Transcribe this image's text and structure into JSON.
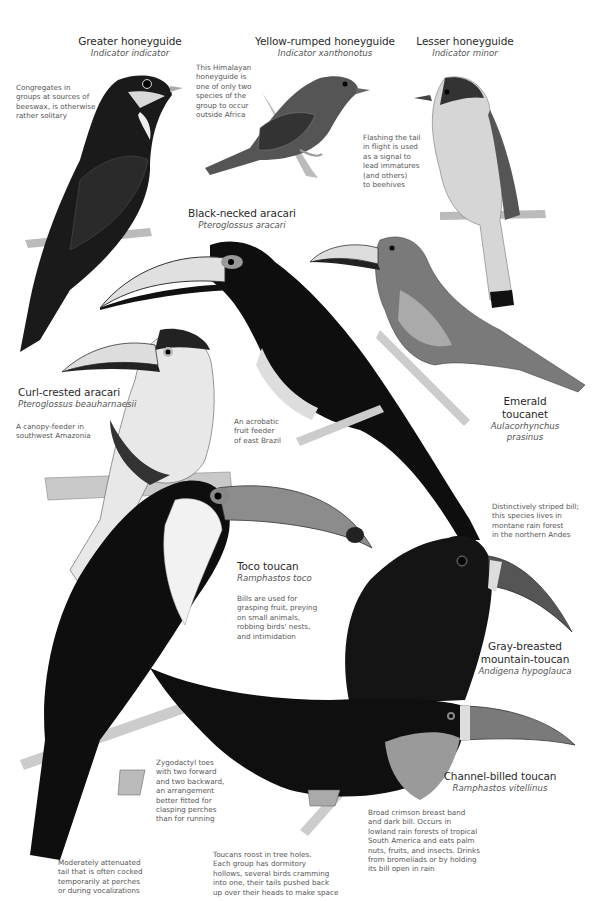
{
  "plate": {
    "species": [
      {
        "id": "greater-honeyguide",
        "common": "Greater honeyguide",
        "scientific": "Indicator indicator",
        "note": "Congregates in groups at sources of beeswax, is otherwise rather solitary"
      },
      {
        "id": "yellow-rumped-honeyguide",
        "common": "Yellow-rumped honeyguide",
        "scientific": "Indicator xanthonotus",
        "note": "This Himalayan honeyguide is one of only two species of the group to occur outside Africa"
      },
      {
        "id": "lesser-honeyguide",
        "common": "Lesser honeyguide",
        "scientific": "Indicator minor",
        "note": "Flashing the tail in flight is used as a signal to lead immatures (and others) to beehives"
      },
      {
        "id": "black-necked-aracari",
        "common": "Black-necked aracari",
        "scientific": "Pteroglossus aracari",
        "note": "An acrobatic fruit feeder of east Brazil"
      },
      {
        "id": "curl-crested-aracari",
        "common": "Curl-crested aracari",
        "scientific": "Pteroglossus beauharnaesii",
        "note": "A canopy-feeder in southwest Amazonia"
      },
      {
        "id": "emerald-toucanet",
        "common_line1": "Emerald",
        "common_line2": "toucanet",
        "scientific_line1": "Aulacorhynchus",
        "scientific_line2": "prasinus"
      },
      {
        "id": "toco-toucan",
        "common": "Toco toucan",
        "scientific": "Ramphastos toco",
        "note": "Bills are used for grasping fruit, preying on small animals, robbing birds' nests, and intimidation"
      },
      {
        "id": "gray-breasted-mountain-toucan",
        "common_line1": "Gray-breasted",
        "common_line2": "mountain-toucan",
        "scientific": "Andigena hypoglauca",
        "note": "Distinctively striped bill; this species lives in montane rain forest in the northern Andes"
      },
      {
        "id": "channel-billed-toucan",
        "common": "Channel-billed toucan",
        "scientific": "Ramphastos vitellinus",
        "note": "Broad crimson breast band and dark bill. Occurs in lowland rain forests of tropical South America and eats palm nuts, fruits, and insects. Drinks from bromeliads or by holding its bill open in rain"
      }
    ],
    "notes": {
      "greater_honeyguide": [
        "Congregates in",
        "groups at sources of",
        "beeswax, is otherwise",
        "rather solitary"
      ],
      "yellow_rumped": [
        "This Himalayan",
        "honeyguide is",
        "one of only two",
        "species of the",
        "group to occur",
        "outside Africa"
      ],
      "lesser_honeyguide": [
        "Flashing the tail",
        "in flight is used",
        "as a signal to",
        "lead immatures",
        "(and others)",
        "to beehives"
      ],
      "curl_crested": [
        "A canopy-feeder in",
        "southwest Amazonia"
      ],
      "black_necked": [
        "An acrobatic",
        "fruit feeder",
        "of east Brazil"
      ],
      "mountain_toucan": [
        "Distinctively striped bill;",
        "this species lives in",
        "montane rain forest",
        "in the northern Andes"
      ],
      "toco": [
        "Bills are used for",
        "grasping fruit, preying",
        "on small animals,",
        "robbing birds' nests,",
        "and intimidation"
      ],
      "zygodactyl": [
        "Zygodactyl toes",
        "with two forward",
        "and two backward,",
        "an arrangement",
        "better fitted for",
        "clasping perches",
        "than for running"
      ],
      "channel_billed": [
        "Broad crimson breast band",
        "and dark bill. Occurs in",
        "lowland rain forests of tropical",
        "South America and eats palm",
        "nuts, fruits, and insects. Drinks",
        "from bromeliads or by holding",
        "its bill open in rain"
      ],
      "roost": [
        "Toucans roost in tree holes.",
        "Each group has dormitory",
        "hollows, several birds cramming",
        "into one, their tails pushed back",
        "up over their heads to make space"
      ],
      "tail": [
        "Moderately attenuated",
        "tail that is often cocked",
        "temporarily at perches",
        "or during vocalizations"
      ]
    },
    "colors": {
      "background": "#ffffff",
      "text": "#333333",
      "ink_dark": "#111111",
      "ink_mid": "#6e6e6e",
      "ink_light": "#c8c8c8"
    }
  }
}
